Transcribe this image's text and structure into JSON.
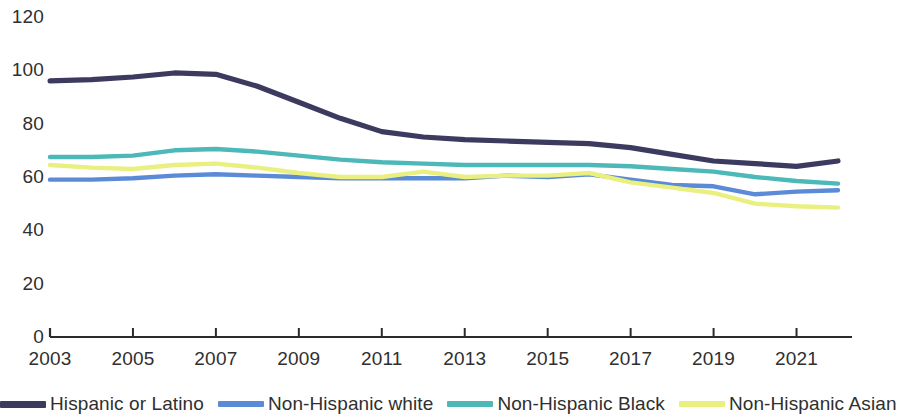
{
  "chart_data": {
    "type": "line",
    "title": "",
    "subtitle": "",
    "xlabel": "",
    "ylabel": "",
    "xlim": [
      2003,
      2022
    ],
    "ylim": [
      0,
      120
    ],
    "grid": false,
    "legend_position": "bottom",
    "x": [
      2003,
      2004,
      2005,
      2006,
      2007,
      2008,
      2009,
      2010,
      2011,
      2012,
      2013,
      2014,
      2015,
      2016,
      2017,
      2018,
      2019,
      2020,
      2021,
      2022
    ],
    "x_tick_labels": [
      "2003",
      "2005",
      "2007",
      "2009",
      "2011",
      "2013",
      "2015",
      "2017",
      "2019",
      "2021"
    ],
    "x_ticks": [
      2003,
      2005,
      2007,
      2009,
      2011,
      2013,
      2015,
      2017,
      2019,
      2021
    ],
    "y_tick_labels": [
      "0",
      "20",
      "40",
      "60",
      "80",
      "100",
      "120"
    ],
    "y_ticks": [
      0,
      20,
      40,
      60,
      80,
      100,
      120
    ],
    "series": [
      {
        "name": "Hispanic or Latino",
        "color": "#3c3a5e",
        "values": [
          96,
          96.5,
          97.5,
          99,
          98.5,
          94,
          88,
          82,
          77,
          75,
          74,
          73.5,
          73,
          72.5,
          71,
          68.5,
          66,
          65,
          64,
          66
        ]
      },
      {
        "name": "Non-Hispanic white",
        "color": "#5b8ad6",
        "values": [
          59,
          59,
          59.5,
          60.5,
          61,
          60.5,
          60,
          59.5,
          59.5,
          59.5,
          59.5,
          60.5,
          60,
          61,
          59,
          57,
          56.5,
          53.5,
          54.5,
          55
        ]
      },
      {
        "name": "Non-Hispanic Black",
        "color": "#4cb8b8",
        "values": [
          67.5,
          67.5,
          68,
          70,
          70.5,
          69.5,
          68,
          66.5,
          65.5,
          65,
          64.5,
          64.5,
          64.5,
          64.5,
          64,
          63,
          62,
          60,
          58.5,
          57.5
        ]
      },
      {
        "name": "Non-Hispanic Asian",
        "color": "#e9f07f",
        "values": [
          64.5,
          63.5,
          63,
          64.5,
          65,
          63.5,
          61.5,
          60,
          60,
          62,
          60,
          60.5,
          60.5,
          61.5,
          58,
          56,
          54,
          50,
          49,
          48.5
        ]
      }
    ]
  },
  "axes": {
    "y_labels": [
      "120",
      "100",
      "80",
      "60",
      "40",
      "20",
      "0"
    ],
    "x_labels": [
      "2003",
      "2005",
      "2007",
      "2009",
      "2011",
      "2013",
      "2015",
      "2017",
      "2019",
      "2021"
    ]
  },
  "legend": {
    "items": [
      {
        "label": "Hispanic or Latino",
        "color": "#3c3a5e"
      },
      {
        "label": "Non-Hispanic white",
        "color": "#5b8ad6"
      },
      {
        "label": "Non-Hispanic Black",
        "color": "#4cb8b8"
      },
      {
        "label": "Non-Hispanic Asian",
        "color": "#e9f07f"
      }
    ]
  },
  "colors": {
    "axis": "#2b2b2b",
    "text": "#2f2f2f",
    "background": "#ffffff"
  }
}
